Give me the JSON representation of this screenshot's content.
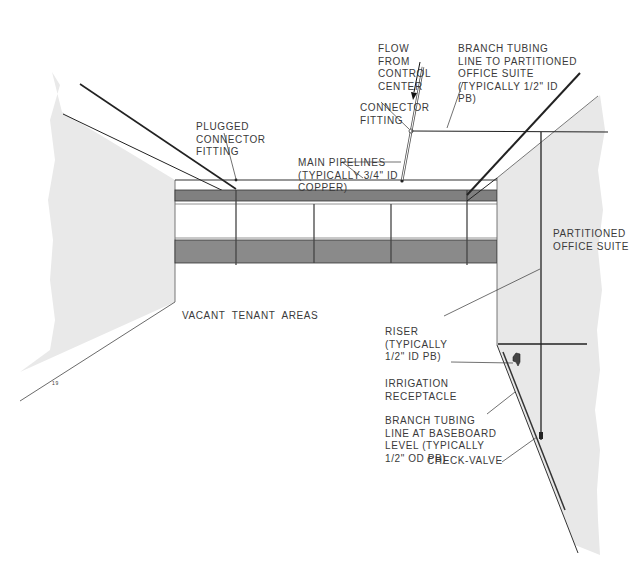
{
  "diagram": {
    "colors": {
      "background": "#ffffff",
      "wall_fill": "#e8e8e8",
      "band_fill": "#7d7d7d",
      "line": "#222222",
      "text": "#3a3a3a"
    },
    "labels": {
      "flow": [
        "FLOW",
        "FROM",
        "CONTROL",
        "CENTER"
      ],
      "branch_top": [
        "BRANCH TUBING",
        "LINE TO PARTITIONED",
        "OFFICE SUITE",
        "(TYPICALLY 1/2\" ID",
        "PB)"
      ],
      "connector": [
        "CONNECTOR",
        "FITTING"
      ],
      "plugged": [
        "PLUGGED",
        "CONNECTOR",
        "FITTING"
      ],
      "main": [
        "MAIN PIPELINES",
        "(TYPICALLY 3/4\" ID",
        "COPPER)"
      ],
      "partitioned": [
        "PARTITIONED",
        "OFFICE SUITE"
      ],
      "vacant": "VACANT  TENANT  AREAS",
      "riser": [
        "RISER",
        "(TYPICALLY",
        "1/2\" ID PB)"
      ],
      "irrigation": [
        "IRRIGATION",
        "RECEPTACLE"
      ],
      "branch_base": [
        "BRANCH TUBING",
        "LINE AT BASEBOARD",
        "LEVEL (TYPICALLY",
        "1/2\" OD PB)"
      ],
      "check_valve": "CHECK-VALVE",
      "figure_mark": "19"
    }
  }
}
